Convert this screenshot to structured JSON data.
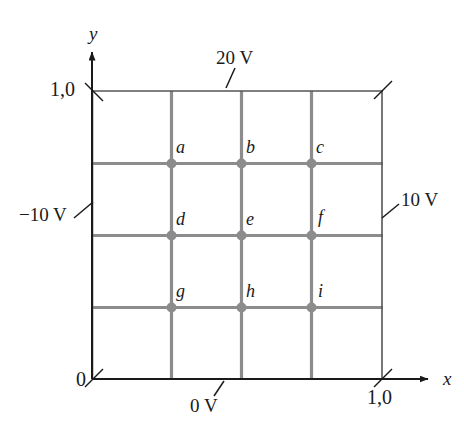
{
  "figure": {
    "type": "potential-grid-diagram",
    "axes": {
      "x_label": "x",
      "y_label": "y",
      "origin_label": "0",
      "x_max_label": "1,0",
      "y_max_label": "1,0"
    },
    "boundary_potentials": {
      "top": "20 V",
      "bottom": "0 V",
      "left": "−10 V",
      "right": "10 V"
    },
    "nodes": [
      {
        "id": "a",
        "label": "a",
        "col": 1,
        "row": 1
      },
      {
        "id": "b",
        "label": "b",
        "col": 2,
        "row": 1
      },
      {
        "id": "c",
        "label": "c",
        "col": 3,
        "row": 1
      },
      {
        "id": "d",
        "label": "d",
        "col": 1,
        "row": 2
      },
      {
        "id": "e",
        "label": "e",
        "col": 2,
        "row": 2
      },
      {
        "id": "f",
        "label": "f",
        "col": 3,
        "row": 2
      },
      {
        "id": "g",
        "label": "g",
        "col": 1,
        "row": 3
      },
      {
        "id": "h",
        "label": "h",
        "col": 2,
        "row": 3
      },
      {
        "id": "i",
        "label": "i",
        "col": 3,
        "row": 3
      }
    ],
    "colors": {
      "grid_line": "#8c8c8c",
      "boundary_line": "#6e6e6e",
      "axis": "#1a1a1a",
      "node_dot": "#8c8c8c",
      "text": "#1a1a1a",
      "background": "#ffffff"
    }
  }
}
